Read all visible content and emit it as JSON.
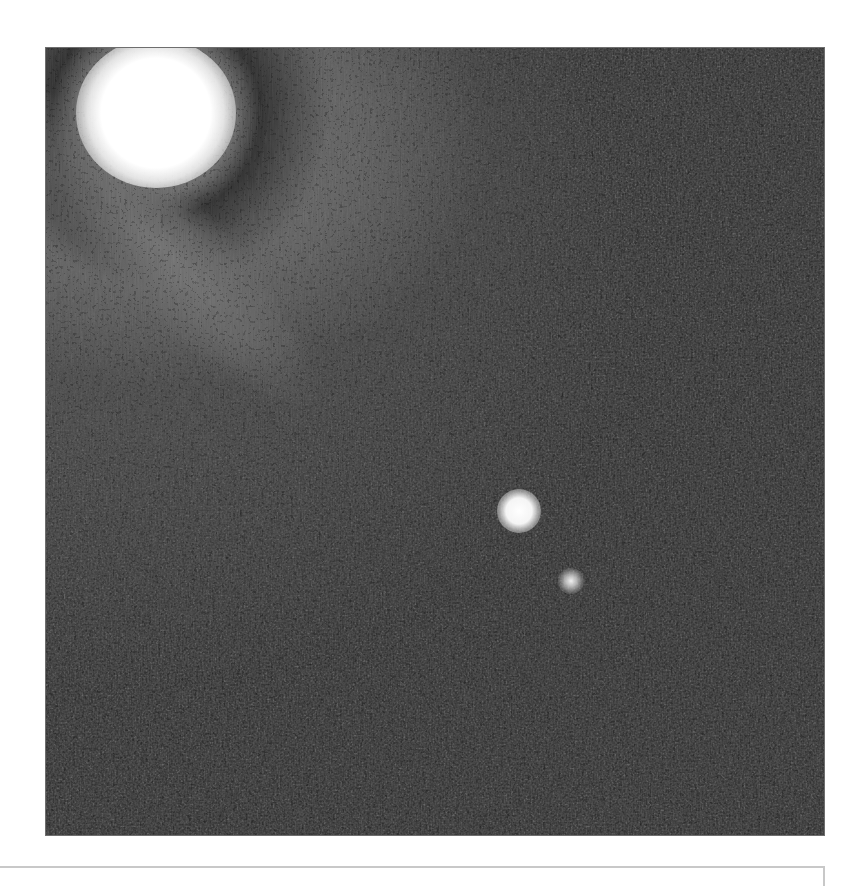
{
  "image": {
    "description": "Grayscale astronomical image: bright saturated star in the upper-left corner with diffuse halo, and an elongated diagonal galaxy/streak in the lower right with two bright knots",
    "colors": {
      "background": "#1c1c1c",
      "haze": "#6e6e6e",
      "highlight": "#ffffff",
      "page": "#ffffff",
      "caption_border": "#c8c8c8"
    },
    "objects": [
      {
        "name": "bright-star",
        "approx_center": [
          155,
          110
        ]
      },
      {
        "name": "galaxy-knot-primary",
        "approx_center": [
          518,
          510
        ]
      },
      {
        "name": "galaxy-knot-secondary",
        "approx_center": [
          570,
          580
        ]
      },
      {
        "name": "galaxy-streak",
        "from": [
          480,
          460
        ],
        "to": [
          780,
          790
        ]
      }
    ]
  },
  "caption": {
    "text": ""
  }
}
